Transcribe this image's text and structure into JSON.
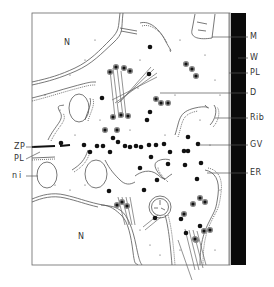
{
  "figure": {
    "type": "cell-ultrastructure-diagram",
    "nucleus_labels": [
      "N",
      "N"
    ],
    "right_labels": [
      {
        "text": "M",
        "y": 37
      },
      {
        "text": "W",
        "y": 58
      },
      {
        "text": "PL",
        "y": 73
      },
      {
        "text": "D",
        "y": 93
      },
      {
        "text": "Rib",
        "y": 118
      },
      {
        "text": "GV",
        "y": 145
      },
      {
        "text": "ER",
        "y": 173
      }
    ],
    "left_labels": [
      {
        "text": "ZP",
        "y": 147
      },
      {
        "text": "PL",
        "y": 159
      },
      {
        "text": "ni",
        "y": 176
      }
    ],
    "colors": {
      "line": "#555555",
      "wall": "#0a0a0a",
      "vesicle": "#111111",
      "background": "#ffffff"
    }
  }
}
